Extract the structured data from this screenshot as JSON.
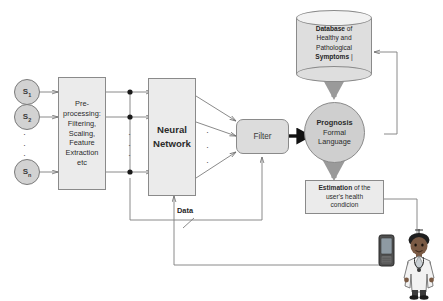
{
  "diagram": {
    "colors": {
      "node_fill": "#ebebeb",
      "sensor_fill": "#d2d2d2",
      "filter_fill": "#dcdcdc",
      "prognosis_fill": "#cfcfcf",
      "database_fill": "#dedede",
      "stroke": "#8a8a8a",
      "line": "#7d7d7d",
      "thick_arrow": "#111111",
      "text": "#1f1f1f"
    }
  },
  "sensors": [
    {
      "id": "s1",
      "label": "S",
      "sub": "1"
    },
    {
      "id": "s2",
      "label": "S",
      "sub": "2"
    },
    {
      "id": "sn",
      "label": "S",
      "sub": "n"
    }
  ],
  "sensor_ellipsis": "·",
  "nodes": {
    "preprocessing": {
      "name": "Pre-processing",
      "lines": [
        "Pre-",
        "processing:",
        "Filtering,",
        "Scaling,",
        "Feature",
        "Extraction",
        "etc"
      ]
    },
    "neural_network": {
      "lines": [
        "Neural",
        "Network"
      ]
    },
    "filter": {
      "label": "Filter"
    },
    "prognosis": {
      "line1": "Prognosis",
      "line2": "Formal",
      "line3": "Language"
    },
    "database": {
      "line1_bold": "Database",
      "line1_rest": " of",
      "line2": "Healthy and",
      "line3": "Pathological",
      "line4_bold": "Symptoms",
      "line4_rest": " |"
    },
    "estimation": {
      "line1_bold": "Estimation",
      "line1_rest": " of the",
      "line2": "user's health",
      "line3": "condicion"
    }
  },
  "labels": {
    "data": "Data"
  },
  "actors": {
    "doctor": "doctor-figure",
    "phone": "mobile-phone"
  }
}
